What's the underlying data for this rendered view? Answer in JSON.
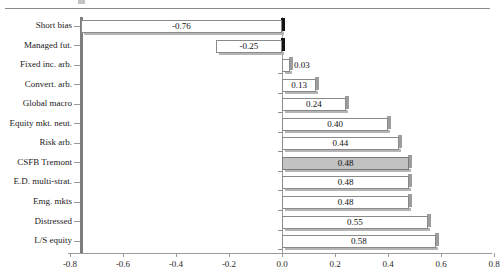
{
  "figure": {
    "name": "hedge-fund-index-bar-chart",
    "top_rule": true
  },
  "chart_data": {
    "type": "bar",
    "orientation": "horizontal",
    "title": "",
    "xlabel": "",
    "ylabel": "",
    "xlim": [
      -0.8,
      0.8
    ],
    "grid": false,
    "legend": null,
    "xticks": [
      "-0.8",
      "-0.6",
      "-0.4",
      "-0.2",
      "0.0",
      "0.2",
      "0.4",
      "0.6",
      "0.8"
    ],
    "xtick_values": [
      -0.8,
      -0.6,
      -0.4,
      -0.2,
      0.0,
      0.2,
      0.4,
      0.6,
      0.8
    ],
    "categories": [
      "Short bias",
      "Managed fut.",
      "Fixed inc. arb.",
      "Convert. arb.",
      "Global macro",
      "Equity mkt. neut.",
      "Risk arb.",
      "CSFB Tremont",
      "E.D. multi-strat.",
      "Emg. mkts",
      "Distressed",
      "L/S equity"
    ],
    "values": [
      -0.76,
      -0.25,
      0.03,
      0.13,
      0.24,
      0.4,
      0.44,
      0.48,
      0.48,
      0.48,
      0.55,
      0.58
    ],
    "labels": [
      "-0.76",
      "-0.25",
      "0.03",
      "0.13",
      "0.24",
      "0.40",
      "0.44",
      "0.48",
      "0.48",
      "0.48",
      "0.55",
      "0.58"
    ],
    "highlight_index": 7,
    "highlight_label": "CSFB Tremont",
    "colors": {
      "bar_fill": "#ffffff",
      "bar_edge": "#8a8a8a",
      "highlight_fill": "#c2c2c2",
      "shadow_positive": "#9d9d9d",
      "shadow_negative": "#141414",
      "axis": "#9b9b9b"
    }
  }
}
